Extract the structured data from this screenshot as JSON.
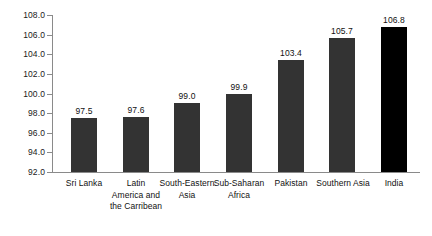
{
  "chart_data": {
    "type": "bar",
    "title": "",
    "subtitle": "",
    "xlabel": "",
    "ylabel": "",
    "ylim": [
      92.0,
      108.0
    ],
    "ytick_step": 2.0,
    "ytick_labels": [
      "92.0",
      "94.0",
      "96.0",
      "98.0",
      "100.0",
      "102.0",
      "104.0",
      "106.0",
      "108.0"
    ],
    "ytick_values": [
      92.0,
      94.0,
      96.0,
      98.0,
      100.0,
      102.0,
      104.0,
      106.0,
      108.0
    ],
    "grid": false,
    "legend": "none",
    "categories": [
      "Sri Lanka",
      "Latin America and the Carribean",
      "South-Eastern Asia",
      "Sub-Saharan Africa",
      "Pakistan",
      "Southern Asia",
      "India"
    ],
    "category_lines": [
      [
        "Sri Lanka"
      ],
      [
        "Latin",
        "America and",
        "the Carribean"
      ],
      [
        "South-Eastern",
        "Asia"
      ],
      [
        "Sub-Saharan",
        "Africa"
      ],
      [
        "Pakistan"
      ],
      [
        "Southern Asia"
      ],
      [
        "India"
      ]
    ],
    "values": [
      97.5,
      97.6,
      99.0,
      99.9,
      103.4,
      105.7,
      106.8
    ],
    "value_labels": [
      "97.5",
      "97.6",
      "99.0",
      "99.9",
      "103.4",
      "105.7",
      "106.8"
    ],
    "bar_colors": [
      "#333333",
      "#333333",
      "#333333",
      "#333333",
      "#333333",
      "#333333",
      "#000000"
    ],
    "highlight_category": "India",
    "axis_color": "#8a8a8a",
    "background_color": "#ffffff",
    "text_color": "#111111"
  }
}
